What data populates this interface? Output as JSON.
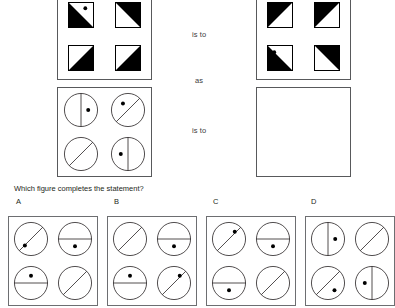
{
  "question": "Which figure completes the statement?",
  "relations": [
    {
      "text": "is to"
    },
    {
      "text": "as"
    },
    {
      "text": "is to"
    }
  ],
  "colors": {
    "ink": "#231f20",
    "fill": "#000000",
    "stroke": "#58595b",
    "option_stroke": "#6d6e71",
    "background": "#ffffff"
  },
  "matrix_panels": [
    {
      "name": "panel-a-squares",
      "shape": "square",
      "cells": [
        {
          "pos": "top-left",
          "diagonal": "tl-br",
          "filled_side": "lower-left",
          "dot": "upper-right"
        },
        {
          "pos": "top-right",
          "diagonal": "tl-br",
          "filled_side": "upper-right",
          "dot": "none"
        },
        {
          "pos": "bottom-left",
          "diagonal": "tl-br",
          "filled_side": "lower-right",
          "dot": "none"
        },
        {
          "pos": "bottom-right",
          "diagonal": "tl-br",
          "filled_side": "lower-right",
          "dot": "none"
        }
      ]
    },
    {
      "name": "panel-b-squares",
      "shape": "square",
      "cells": [
        {
          "pos": "top-left",
          "diagonal": "tr-bl",
          "filled_side": "upper-left",
          "dot": "none"
        },
        {
          "pos": "top-right",
          "diagonal": "tr-bl",
          "filled_side": "upper-left",
          "dot": "none"
        },
        {
          "pos": "bottom-left",
          "diagonal": "tl-br",
          "filled_side": "lower-left",
          "dot": "upper-left"
        },
        {
          "pos": "bottom-right",
          "diagonal": "tr-bl",
          "filled_side": "upper-right",
          "dot": "none"
        }
      ]
    },
    {
      "name": "panel-c-circles",
      "shape": "circle",
      "cells": [
        {
          "pos": "top-left",
          "line": "vertical",
          "dot": "right"
        },
        {
          "pos": "top-right",
          "line": "diag-ne-sw",
          "dot": "upper-left"
        },
        {
          "pos": "bottom-left",
          "line": "diag-ne-sw",
          "dot": "none"
        },
        {
          "pos": "bottom-right",
          "line": "vertical",
          "dot": "left"
        }
      ]
    },
    {
      "name": "panel-d-answer-blank",
      "shape": "blank",
      "cells": []
    }
  ],
  "options": [
    {
      "label": "A",
      "cells": [
        {
          "pos": "top-left",
          "line": "diag-ne-sw",
          "dot": "lower-left"
        },
        {
          "pos": "top-right",
          "line": "horizontal",
          "dot": "below"
        },
        {
          "pos": "bottom-left",
          "line": "horizontal",
          "dot": "above"
        },
        {
          "pos": "bottom-right",
          "line": "diag-ne-sw",
          "dot": "none"
        }
      ]
    },
    {
      "label": "B",
      "cells": [
        {
          "pos": "top-left",
          "line": "diag-ne-sw",
          "dot": "none"
        },
        {
          "pos": "top-right",
          "line": "horizontal",
          "dot": "below"
        },
        {
          "pos": "bottom-left",
          "line": "horizontal",
          "dot": "above"
        },
        {
          "pos": "bottom-right",
          "line": "diag-ne-sw",
          "dot": "upper-right"
        }
      ]
    },
    {
      "label": "C",
      "cells": [
        {
          "pos": "top-left",
          "line": "diag-ne-sw",
          "dot": "upper-right"
        },
        {
          "pos": "top-right",
          "line": "horizontal",
          "dot": "below"
        },
        {
          "pos": "bottom-left",
          "line": "horizontal",
          "dot": "below"
        },
        {
          "pos": "bottom-right",
          "line": "diag-ne-sw",
          "dot": "none"
        }
      ]
    },
    {
      "label": "D",
      "cells": [
        {
          "pos": "top-left",
          "line": "vertical",
          "dot": "right"
        },
        {
          "pos": "top-right",
          "line": "diag-ne-sw",
          "dot": "none"
        },
        {
          "pos": "bottom-left",
          "line": "diag-ne-sw",
          "dot": "lower-right"
        },
        {
          "pos": "bottom-right",
          "line": "vertical",
          "dot": "left"
        }
      ]
    }
  ]
}
